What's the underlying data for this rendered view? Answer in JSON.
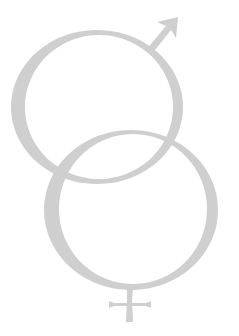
{
  "image": {
    "description": "Interlocked male and female gender symbols drawn in light grey calligraphic strokes",
    "symbols": [
      {
        "name": "male-symbol",
        "glyph": "♂"
      },
      {
        "name": "female-symbol",
        "glyph": "♀"
      }
    ],
    "colors": {
      "stroke": "#cfcfcf",
      "background": "#ffffff"
    }
  }
}
